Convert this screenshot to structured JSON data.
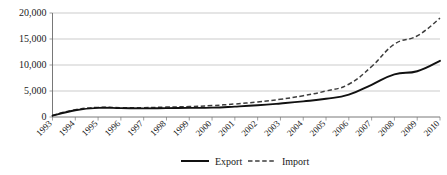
{
  "chart_data": {
    "type": "line",
    "title": "",
    "subtitle": "",
    "xlabel": "",
    "ylabel": "",
    "x": [
      1993,
      1994,
      1995,
      1996,
      1997,
      1998,
      1999,
      2000,
      2001,
      2002,
      2003,
      2004,
      2005,
      2006,
      2007,
      2008,
      2009,
      2010
    ],
    "categories": [
      "1993",
      "1994",
      "1995",
      "1996",
      "1997",
      "1998",
      "1999",
      "2000",
      "2001",
      "2002",
      "2003",
      "2004",
      "2005",
      "2006",
      "2007",
      "2008",
      "2009",
      "2010"
    ],
    "series": [
      {
        "name": "Export",
        "style": "solid",
        "color": "#111111",
        "values": [
          250,
          1300,
          1750,
          1700,
          1650,
          1700,
          1750,
          1800,
          2000,
          2250,
          2600,
          3000,
          3500,
          4300,
          6200,
          8200,
          8800,
          10800
        ]
      },
      {
        "name": "Import",
        "style": "dashed",
        "color": "#3d3d3d",
        "values": [
          300,
          1400,
          1850,
          1800,
          1800,
          1900,
          2000,
          2200,
          2500,
          2900,
          3400,
          4100,
          5000,
          6300,
          9700,
          14000,
          15600,
          19000
        ]
      }
    ],
    "ylim": [
      0,
      20000
    ],
    "yticks": [
      0,
      5000,
      10000,
      15000,
      20000
    ],
    "ytick_labels": [
      "0",
      "5,000",
      "10,000",
      "15,000",
      "20,000"
    ],
    "grid": true,
    "grid_axis": "y",
    "legend_position": "bottom",
    "legend": [
      {
        "label": "Export",
        "style": "solid"
      },
      {
        "label": "Import",
        "style": "dashed"
      }
    ]
  }
}
